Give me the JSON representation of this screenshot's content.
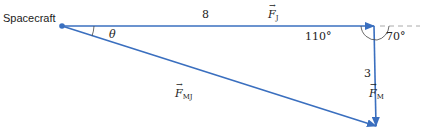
{
  "diagram": {
    "title_label": "Spacecraft",
    "angle_theta": "θ",
    "magnitude_fj": "8",
    "magnitude_fm": "3",
    "angle_110": "110°",
    "angle_70": "70°",
    "vectors": {
      "fj": {
        "symbol": "F",
        "subscript": "J"
      },
      "fm": {
        "symbol": "F",
        "subscript": "M"
      },
      "fmj": {
        "symbol": "F",
        "subscript": "MJ"
      }
    },
    "colors": {
      "vector": "#3a6fbf",
      "dashed": "#aaaaaa",
      "arc": "#444444"
    }
  }
}
